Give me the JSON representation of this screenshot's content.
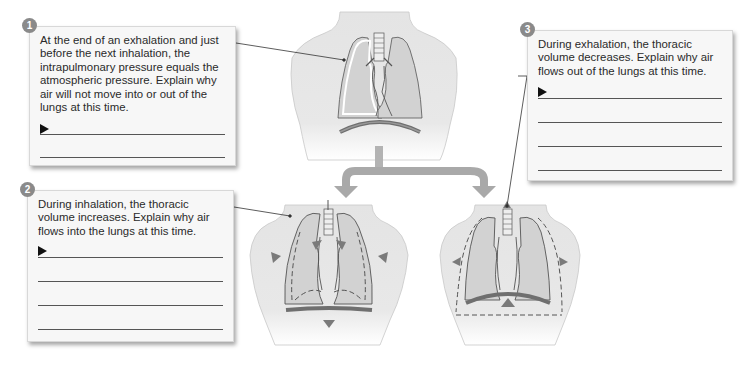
{
  "questions": [
    {
      "number": "1",
      "text": "At the end of an exhalation and just before the next inhalation, the intrapulmonary pressure equals the atmospheric pressure. Explain why air will not move into or out of the lungs at this time.",
      "answer_lines": 2
    },
    {
      "number": "2",
      "text": "During inhalation, the thoracic volume increases. Explain why air flows into the lungs at this time.",
      "answer_lines": 4
    },
    {
      "number": "3",
      "text": "During exhalation, the thoracic volume decreases. Explain why air flows out of the lungs at this time.",
      "answer_lines": 4
    }
  ],
  "figures": {
    "top": "Lungs at rest (end of exhalation)",
    "left": "Lungs during inhalation",
    "right": "Lungs during exhalation"
  },
  "colors": {
    "card_bg": "#f7f7f7",
    "badge": "#8a8a8a",
    "connector_arrow": "#a9a9a9",
    "diaphragm": "#707070",
    "movement_arrow": "#7a7a7a"
  }
}
